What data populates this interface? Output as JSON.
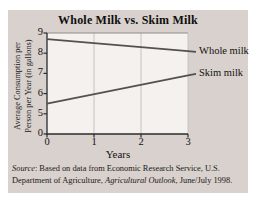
{
  "page": {
    "background": "#ffffff",
    "card_background": "#d8d1cd",
    "plot_background": "#f4f1ee"
  },
  "chart_data": {
    "type": "line",
    "title": "Whole Milk vs. Skim Milk",
    "xlabel": "Years",
    "ylabel": "Average Consumption per Person per Year (in gallons)",
    "ylabel_lines": [
      "Average Consumption per",
      "Person per Year (in gallons)"
    ],
    "xlim": [
      0,
      3
    ],
    "ylim_visible": [
      5,
      9
    ],
    "x_ticks": [
      0,
      1,
      2,
      3
    ],
    "y_ticks": [
      9,
      8,
      7,
      6,
      5,
      0
    ],
    "y_axis_break_between": [
      0,
      5
    ],
    "grid": "vertical-only",
    "legend_position": "labels-at-line-ends-right",
    "line_color": "#55504d",
    "grid_color": "#c8c2bd",
    "axis_color": "#2b2b2b",
    "series": [
      {
        "name": "Whole milk",
        "x": [
          0,
          3
        ],
        "values": [
          8.7,
          8.1
        ]
      },
      {
        "name": "Skim milk",
        "x": [
          0,
          3
        ],
        "values": [
          5.5,
          6.9
        ]
      }
    ]
  },
  "source": {
    "word_italic": "Source",
    "line1_rest": ": Based on data from Economic Research Service, U.S.",
    "line2_a": "Department of Agriculture, ",
    "line2_italic": "Agricultural Outlook",
    "line2_b": ", June/July 1998."
  }
}
